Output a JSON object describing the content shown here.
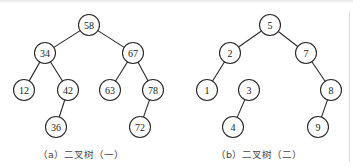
{
  "figures": [
    {
      "id": "a",
      "caption": "（a）二叉树（一）",
      "nodes": [
        {
          "id": "58",
          "label": "58"
        },
        {
          "id": "34",
          "label": "34"
        },
        {
          "id": "67",
          "label": "67"
        },
        {
          "id": "12",
          "label": "12"
        },
        {
          "id": "42",
          "label": "42"
        },
        {
          "id": "63",
          "label": "63"
        },
        {
          "id": "78",
          "label": "78"
        },
        {
          "id": "36",
          "label": "36"
        },
        {
          "id": "72",
          "label": "72"
        }
      ],
      "edges": [
        [
          "58",
          "34"
        ],
        [
          "58",
          "67"
        ],
        [
          "34",
          "12"
        ],
        [
          "34",
          "42"
        ],
        [
          "67",
          "63"
        ],
        [
          "67",
          "78"
        ],
        [
          "42",
          "36"
        ],
        [
          "78",
          "72"
        ]
      ]
    },
    {
      "id": "b",
      "caption": "（b）二叉树（二）",
      "nodes": [
        {
          "id": "5",
          "label": "5"
        },
        {
          "id": "2",
          "label": "2"
        },
        {
          "id": "7",
          "label": "7"
        },
        {
          "id": "1",
          "label": "1"
        },
        {
          "id": "3",
          "label": "3"
        },
        {
          "id": "8",
          "label": "8"
        },
        {
          "id": "4",
          "label": "4"
        },
        {
          "id": "9",
          "label": "9"
        }
      ],
      "edges": [
        [
          "5",
          "2"
        ],
        [
          "5",
          "7"
        ],
        [
          "2",
          "1"
        ],
        [
          "7",
          "8"
        ],
        [
          "3",
          "4"
        ],
        [
          "8",
          "9"
        ]
      ]
    }
  ]
}
